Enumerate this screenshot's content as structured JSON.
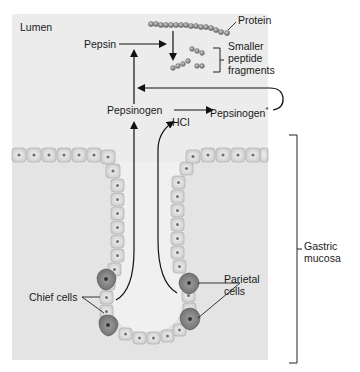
{
  "diagram": {
    "labels": {
      "lumen": "Lumen",
      "pepsin": "Pepsin",
      "protein": "Protein",
      "smaller_peptide_line1": "Smaller",
      "smaller_peptide_line2": "peptide",
      "smaller_peptide_line3": "fragments",
      "pepsinogen": "Pepsinogen",
      "pepsinogen_star": "Pepsinogen",
      "asterisk": "*",
      "hcl": "HCl",
      "gastric_line1": "Gastric",
      "gastric_line2": "mucosa",
      "parietal_line1": "Parietal",
      "parietal_line2": "cells",
      "chief_cells": "Chief cells"
    },
    "colors": {
      "panel_bg": "#ebebeb",
      "page_bg": "#ffffff",
      "cell_fill": "#d9d9d9",
      "cell_border": "#b8b8b8",
      "nucleus": "#6e6e6e",
      "parietal_fill": "#8a8a8a",
      "arrow": "#111111",
      "bead": "#8c8c8c"
    },
    "nodes": [
      {
        "id": "protein",
        "label": "Protein"
      },
      {
        "id": "pepsin",
        "label": "Pepsin"
      },
      {
        "id": "fragments",
        "label": "Smaller peptide fragments"
      },
      {
        "id": "pepsinogen",
        "label": "Pepsinogen"
      },
      {
        "id": "pepsinogen_star",
        "label": "Pepsinogen*"
      },
      {
        "id": "hcl",
        "label": "HCl"
      },
      {
        "id": "chief_cells",
        "label": "Chief cells"
      },
      {
        "id": "parietal_cells",
        "label": "Parietal cells"
      },
      {
        "id": "gastric_mucosa",
        "label": "Gastric mucosa"
      }
    ],
    "edges": [
      {
        "from": "chief_cells",
        "to": "pepsinogen"
      },
      {
        "from": "parietal_cells",
        "to": "hcl"
      },
      {
        "from": "pepsinogen",
        "to": "pepsinogen_star",
        "via": "hcl"
      },
      {
        "from": "pepsinogen_star",
        "to": "pepsinogen",
        "type": "feedback"
      },
      {
        "from": "pepsinogen",
        "to": "pepsin"
      },
      {
        "from": "pepsin",
        "to": "protein",
        "type": "acts-on"
      },
      {
        "from": "protein",
        "to": "fragments"
      }
    ]
  }
}
